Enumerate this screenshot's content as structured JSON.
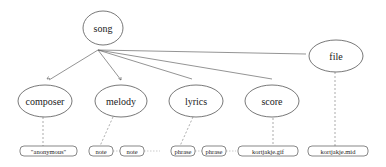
{
  "diagram": {
    "root": {
      "id": "song",
      "label": "song",
      "cx": 103,
      "cy": 28,
      "rx": 20,
      "ry": 17
    },
    "file": {
      "id": "file",
      "label": "file",
      "cx": 336,
      "cy": 56,
      "rx": 27,
      "ry": 16
    },
    "children": [
      {
        "id": "composer",
        "label": "composer",
        "cx": 45,
        "cy": 101,
        "rx": 27,
        "ry": 16
      },
      {
        "id": "melody",
        "label": "melody",
        "cx": 121,
        "cy": 101,
        "rx": 26,
        "ry": 16
      },
      {
        "id": "lyrics",
        "label": "lyrics",
        "cx": 196,
        "cy": 101,
        "rx": 27,
        "ry": 16
      },
      {
        "id": "score",
        "label": "score",
        "cx": 272,
        "cy": 101,
        "rx": 27,
        "ry": 16
      }
    ],
    "leaves": [
      {
        "id": "anonymous",
        "label": "\"anonymous\"",
        "x": 20,
        "y": 146,
        "w": 57,
        "h": 10
      },
      {
        "id": "note-1",
        "label": "note",
        "x": 89,
        "y": 146,
        "w": 24,
        "h": 10
      },
      {
        "id": "note-2",
        "label": "note",
        "x": 120,
        "y": 146,
        "w": 24,
        "h": 10
      },
      {
        "id": "phrase-1",
        "label": "phrase",
        "x": 171,
        "y": 146,
        "w": 24,
        "h": 10
      },
      {
        "id": "phrase-2",
        "label": "phrase",
        "x": 202,
        "y": 146,
        "w": 24,
        "h": 10
      },
      {
        "id": "kortjakje-gif",
        "label": "kortjakje.gif",
        "x": 238,
        "y": 146,
        "w": 60,
        "h": 10
      },
      {
        "id": "kortjakje-mid",
        "label": "kortjakje.mid",
        "x": 308,
        "y": 146,
        "w": 60,
        "h": 10
      }
    ]
  }
}
